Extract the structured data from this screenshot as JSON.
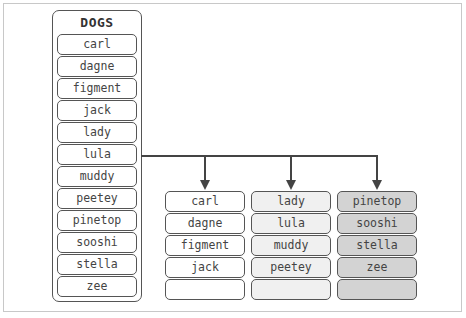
{
  "source": {
    "title": "DOGS",
    "items": [
      "carl",
      "dagne",
      "figment",
      "jack",
      "lady",
      "lula",
      "muddy",
      "peetey",
      "pinetop",
      "sooshi",
      "stella",
      "zee"
    ]
  },
  "buckets": [
    {
      "fill": "#ffffff",
      "items": [
        "carl",
        "dagne",
        "figment",
        "jack",
        ""
      ]
    },
    {
      "fill": "#f0f0f0",
      "items": [
        "lady",
        "lula",
        "muddy",
        "peetey",
        ""
      ]
    },
    {
      "fill": "#d3d3d3",
      "items": [
        "pinetop",
        "sooshi",
        "stella",
        "zee",
        ""
      ]
    }
  ],
  "colors": {
    "stroke": "#444444",
    "text": "#444444"
  }
}
